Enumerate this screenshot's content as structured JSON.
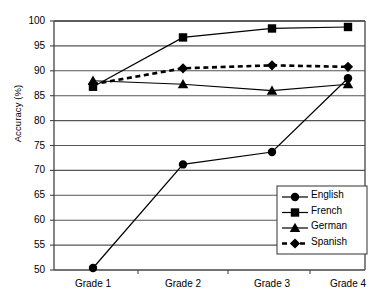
{
  "chart_data": {
    "type": "line",
    "title": "",
    "xlabel": "",
    "ylabel": "Accuracy (%)",
    "categories": [
      "Grade 1",
      "Grade 2",
      "Grade 3",
      "Grade 4"
    ],
    "ylim": [
      50,
      100
    ],
    "ytick_step": 5,
    "yticks": [
      "100",
      "95",
      "90",
      "85",
      "80",
      "75",
      "70",
      "65",
      "60",
      "55",
      "50"
    ],
    "grid": "horizontal",
    "legend_position": "lower-right-inside",
    "series": [
      {
        "name": "English",
        "marker": "circle",
        "line_style": "solid",
        "color": "#000000",
        "values": [
          50.4,
          71.2,
          73.7,
          88.5
        ]
      },
      {
        "name": "French",
        "marker": "square",
        "line_style": "solid",
        "color": "#000000",
        "values": [
          86.8,
          96.7,
          98.5,
          98.8
        ]
      },
      {
        "name": "German",
        "marker": "triangle",
        "line_style": "solid",
        "color": "#000000",
        "values": [
          88.0,
          87.3,
          86.0,
          87.3
        ]
      },
      {
        "name": "Spanish",
        "marker": "diamond",
        "line_style": "dashed",
        "color": "#000000",
        "values": [
          87.3,
          90.5,
          91.1,
          90.8
        ]
      }
    ]
  },
  "legend": {
    "items": [
      {
        "label": "English"
      },
      {
        "label": "French"
      },
      {
        "label": "German"
      },
      {
        "label": "Spanish"
      }
    ]
  },
  "colors": {
    "ink": "#000000",
    "grid": "#555555",
    "axis": "#444444",
    "background": "#ffffff"
  }
}
